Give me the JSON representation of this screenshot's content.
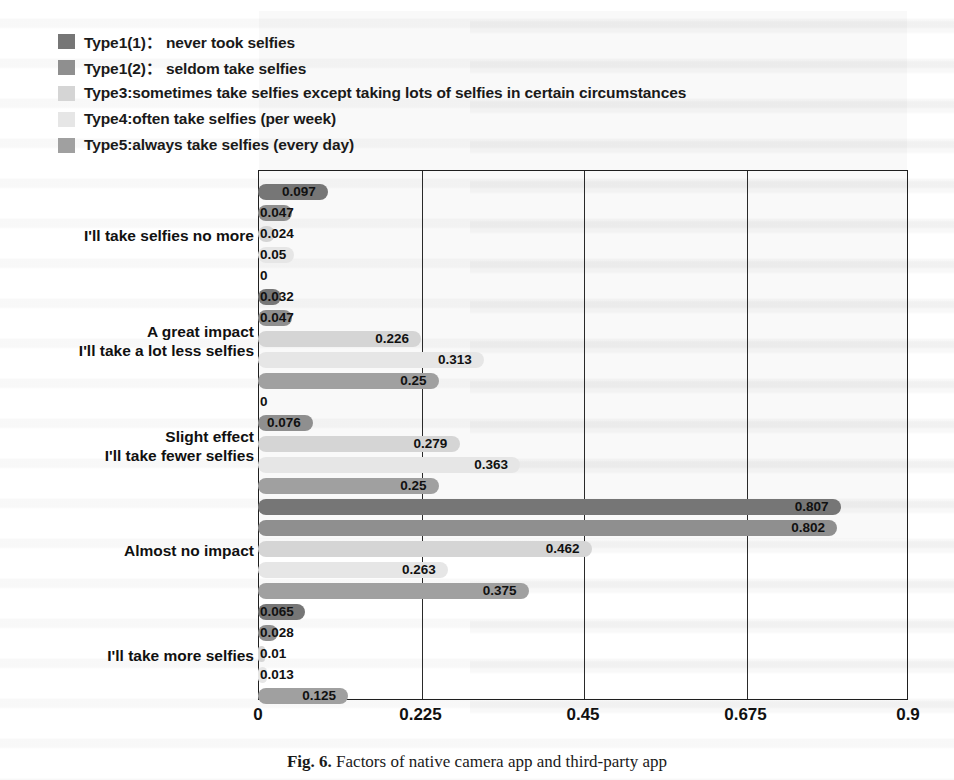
{
  "figure": {
    "caption_label": "Fig. 6.",
    "caption_text": "Factors of native camera app and third-party app"
  },
  "chart_data": {
    "type": "bar",
    "orientation": "horizontal",
    "title": "",
    "xlabel": "",
    "ylabel": "",
    "xlim": [
      0,
      0.9
    ],
    "xticks": [
      "0",
      "0.225",
      "0.45",
      "0.675",
      "0.9"
    ],
    "xtick_values": [
      0,
      0.225,
      0.45,
      0.675,
      0.9
    ],
    "grid": true,
    "grid_axis": "x",
    "legend_position": "above-plot",
    "data_labels": true,
    "categories": [
      "I'll take selfies no more",
      "A great impact\nI'll take a lot less selfies",
      "Slight effect\nI'll take fewer selfies",
      "Almost no impact",
      "I'll take more selfies"
    ],
    "category_lines": [
      [
        "I'll take selfies no more"
      ],
      [
        "A great impact",
        "I'll take a lot less selfies"
      ],
      [
        "Slight effect",
        "I'll take fewer selfies"
      ],
      [
        "Almost no impact"
      ],
      [
        "I'll take more selfies"
      ]
    ],
    "series": [
      {
        "name": "Type1(1)： never took selfies",
        "color": "#767676",
        "values": [
          0.097,
          0.032,
          0,
          0.807,
          0.065
        ],
        "labels": [
          "0.097",
          "0.032",
          "0",
          "0.807",
          "0.065"
        ]
      },
      {
        "name": "Type1(2)： seldom take selfies",
        "color": "#8f8f8f",
        "values": [
          0.047,
          0.047,
          0.076,
          0.802,
          0.028
        ],
        "labels": [
          "0.047",
          "0.047",
          "0.076",
          "0.802",
          "0.028"
        ]
      },
      {
        "name": "Type3:sometimes take selfies except taking lots of selfies in certain circumstances",
        "color": "#d5d5d5",
        "values": [
          0.024,
          0.226,
          0.279,
          0.462,
          0.01
        ],
        "labels": [
          "0.024",
          "0.226",
          "0.279",
          "0.462",
          "0.01"
        ]
      },
      {
        "name": "Type4:often take selfies (per week)",
        "color": "#e6e6e6",
        "values": [
          0.05,
          0.313,
          0.363,
          0.263,
          0.013
        ],
        "labels": [
          "0.05",
          "0.313",
          "0.363",
          "0.263",
          "0.013"
        ]
      },
      {
        "name": "Type5:always take selfies (every day)",
        "color": "#a0a0a0",
        "values": [
          0,
          0.25,
          0.25,
          0.375,
          0.125
        ],
        "labels": [
          "0",
          "0.25",
          "0.25",
          "0.375",
          "0.125"
        ]
      }
    ]
  }
}
